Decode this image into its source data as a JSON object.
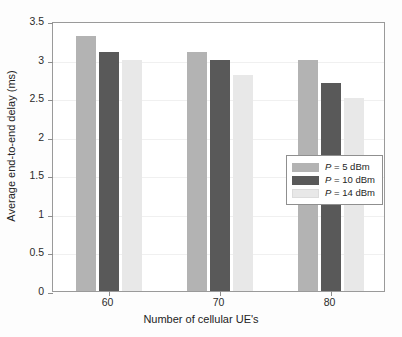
{
  "chart_data": {
    "type": "bar",
    "title": "",
    "subtitle": "",
    "xlabel": "Number of cellular UE's",
    "ylabel": "Average end-to-end delay (ms)",
    "categories": [
      "60",
      "70",
      "80"
    ],
    "series": [
      {
        "name": "P = 5 dBm",
        "name_prefix": "P",
        "name_suffix": " = 5 dBm",
        "color": "#b3b3b3",
        "values": [
          3.3,
          3.1,
          3.0
        ]
      },
      {
        "name": "P = 10 dBm",
        "name_prefix": "P",
        "name_suffix": " = 10 dBm",
        "color": "#595959",
        "values": [
          3.1,
          3.0,
          2.7
        ]
      },
      {
        "name": "P = 14 dBm",
        "name_prefix": "P",
        "name_suffix": " = 14 dBm",
        "color": "#e8e8e8",
        "values": [
          3.0,
          2.8,
          2.5
        ]
      }
    ],
    "ylim": [
      0,
      3.5
    ],
    "yticks": [
      "0",
      "0.5",
      "1",
      "1.5",
      "2",
      "2.5",
      "3",
      "3.5"
    ],
    "ytick_values": [
      0,
      0.5,
      1,
      1.5,
      2,
      2.5,
      3,
      3.5
    ],
    "xticks": [
      "60",
      "70",
      "80"
    ],
    "grid": true,
    "legend_position": "center-right",
    "axis_color": "#9a9a9a",
    "grid_color": "#f0f0f0",
    "background": "#ffffff"
  }
}
